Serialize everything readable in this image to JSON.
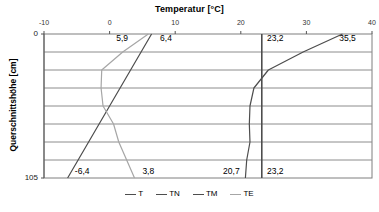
{
  "chart_data": {
    "type": "line",
    "title": "Temperatur [°C]",
    "xlabel": "Temperatur [°C]",
    "ylabel": "Querschnittshöhe [cm]",
    "xlim": [
      -10,
      40
    ],
    "ylim": [
      0,
      105
    ],
    "y_inverted": true,
    "grid": true,
    "x_axis_position": "top",
    "xticks": [
      -10,
      0,
      10,
      20,
      30,
      40
    ],
    "xtick_labels": [
      "-10",
      "0",
      "10",
      "20",
      "30",
      "40"
    ],
    "yticks": [
      0,
      105
    ],
    "ytick_labels": [
      "0",
      "105"
    ],
    "gridlines_y": [
      13.125,
      26.25,
      39.375,
      52.5,
      65.625,
      78.75,
      91.875
    ],
    "legend_position": "bottom",
    "series": [
      {
        "name": "T",
        "color": "#4d4d4d",
        "points": [
          {
            "x": 23.2,
            "y": 0
          },
          {
            "x": 23.2,
            "y": 105
          }
        ]
      },
      {
        "name": "TN",
        "color": "#4d4d4d",
        "points": [
          {
            "x": 6.4,
            "y": 0
          },
          {
            "x": 3.2,
            "y": 26.25
          },
          {
            "x": 0.0,
            "y": 52.5
          },
          {
            "x": -3.2,
            "y": 78.75
          },
          {
            "x": -6.4,
            "y": 105
          }
        ]
      },
      {
        "name": "TM",
        "color": "#4d4d4d",
        "points": [
          {
            "x": 35.5,
            "y": 0
          },
          {
            "x": 29.5,
            "y": 13.125
          },
          {
            "x": 24.2,
            "y": 26.25
          },
          {
            "x": 22.0,
            "y": 39.375
          },
          {
            "x": 21.4,
            "y": 52.5
          },
          {
            "x": 21.3,
            "y": 65.625
          },
          {
            "x": 21.4,
            "y": 78.75
          },
          {
            "x": 20.9,
            "y": 91.875
          },
          {
            "x": 20.7,
            "y": 105
          }
        ]
      },
      {
        "name": "TE",
        "color": "#a6a6a6",
        "points": [
          {
            "x": 5.9,
            "y": 0
          },
          {
            "x": 2.0,
            "y": 13.125
          },
          {
            "x": -1.2,
            "y": 26.25
          },
          {
            "x": -1.3,
            "y": 39.375
          },
          {
            "x": -1.0,
            "y": 52.5
          },
          {
            "x": 0.6,
            "y": 65.625
          },
          {
            "x": 1.4,
            "y": 78.75
          },
          {
            "x": 2.6,
            "y": 91.875
          },
          {
            "x": 3.8,
            "y": 105
          }
        ]
      }
    ],
    "annotations": [
      {
        "id": "lbl-te-top",
        "text": "5,9",
        "x": 1.0,
        "y": 3,
        "series": "TE"
      },
      {
        "id": "lbl-tn-top",
        "text": "6,4",
        "x": 7.7,
        "y": 3,
        "series": "TN"
      },
      {
        "id": "lbl-t-top",
        "text": "23,2",
        "x": 24.0,
        "y": 3,
        "series": "T"
      },
      {
        "id": "lbl-tm-top",
        "text": "35,5",
        "x": 35.0,
        "y": 3,
        "series": "TM"
      },
      {
        "id": "lbl-tn-bottom",
        "text": "-6,4",
        "x": -5.3,
        "y": 100,
        "series": "TN"
      },
      {
        "id": "lbl-te-bottom",
        "text": "3,8",
        "x": 5.0,
        "y": 100,
        "series": "TE"
      },
      {
        "id": "lbl-tm-bottom",
        "text": "20,7",
        "x": 17.3,
        "y": 100,
        "series": "TM"
      },
      {
        "id": "lbl-t-bottom",
        "text": "23,2",
        "x": 24.0,
        "y": 100,
        "series": "T"
      }
    ]
  },
  "legend": {
    "items": [
      {
        "label": "T",
        "color": "#4d4d4d"
      },
      {
        "label": "TN",
        "color": "#4d4d4d"
      },
      {
        "label": "TM",
        "color": "#4d4d4d"
      },
      {
        "label": "TE",
        "color": "#a6a6a6"
      }
    ]
  }
}
